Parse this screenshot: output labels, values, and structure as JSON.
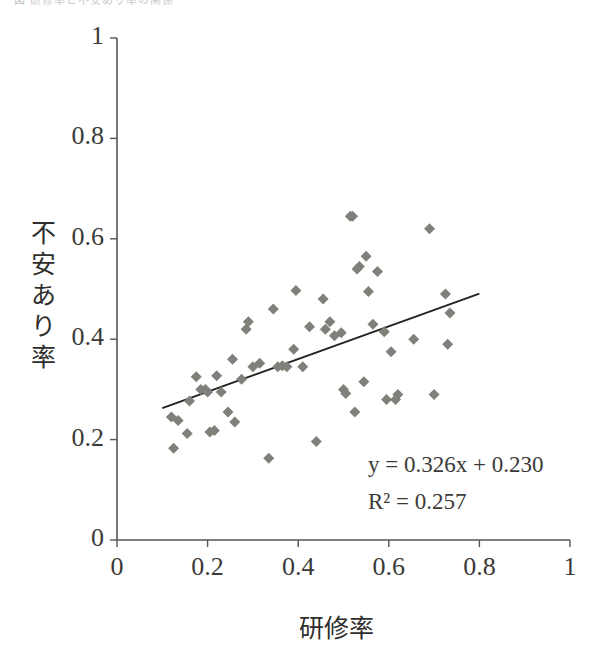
{
  "top_caption": {
    "text": "図  研修率と不安あり率の関係"
  },
  "chart_data": {
    "type": "scatter",
    "title": "",
    "xlabel": "研修率",
    "ylabel": "不安あり率",
    "xlim": [
      0,
      1
    ],
    "ylim": [
      0,
      1
    ],
    "xticks": [
      "0",
      "0.2",
      "0.4",
      "0.6",
      "0.8",
      "1"
    ],
    "yticks": [
      "0",
      "0.2",
      "0.4",
      "0.6",
      "0.8",
      "1"
    ],
    "xtick_values": [
      0,
      0.2,
      0.4,
      0.6,
      0.8,
      1
    ],
    "ytick_values": [
      0,
      0.2,
      0.4,
      0.6,
      0.8,
      1
    ],
    "grid": false,
    "legend": false,
    "marker": "diamond",
    "marker_color": "#80807a",
    "marker_size": 11,
    "axis_color": "#555553",
    "trendline": {
      "color": "#22221f",
      "equation_label": "y = 0.326x + 0.230",
      "r2_label": "R² = 0.257",
      "slope": 0.326,
      "intercept": 0.23,
      "r_squared": 0.257,
      "x_start": 0.1,
      "x_end": 0.8
    },
    "points": [
      [
        0.12,
        0.245
      ],
      [
        0.125,
        0.183
      ],
      [
        0.135,
        0.238
      ],
      [
        0.155,
        0.212
      ],
      [
        0.16,
        0.277
      ],
      [
        0.175,
        0.325
      ],
      [
        0.185,
        0.3
      ],
      [
        0.195,
        0.3
      ],
      [
        0.2,
        0.295
      ],
      [
        0.205,
        0.215
      ],
      [
        0.215,
        0.218
      ],
      [
        0.22,
        0.327
      ],
      [
        0.23,
        0.295
      ],
      [
        0.245,
        0.255
      ],
      [
        0.255,
        0.36
      ],
      [
        0.26,
        0.235
      ],
      [
        0.275,
        0.32
      ],
      [
        0.285,
        0.42
      ],
      [
        0.29,
        0.435
      ],
      [
        0.3,
        0.345
      ],
      [
        0.315,
        0.352
      ],
      [
        0.335,
        0.163
      ],
      [
        0.345,
        0.46
      ],
      [
        0.355,
        0.345
      ],
      [
        0.365,
        0.347
      ],
      [
        0.375,
        0.345
      ],
      [
        0.39,
        0.38
      ],
      [
        0.395,
        0.497
      ],
      [
        0.41,
        0.345
      ],
      [
        0.425,
        0.425
      ],
      [
        0.44,
        0.196
      ],
      [
        0.455,
        0.48
      ],
      [
        0.46,
        0.42
      ],
      [
        0.47,
        0.435
      ],
      [
        0.48,
        0.407
      ],
      [
        0.495,
        0.413
      ],
      [
        0.5,
        0.3
      ],
      [
        0.505,
        0.292
      ],
      [
        0.515,
        0.645
      ],
      [
        0.52,
        0.645
      ],
      [
        0.525,
        0.255
      ],
      [
        0.53,
        0.54
      ],
      [
        0.535,
        0.545
      ],
      [
        0.545,
        0.315
      ],
      [
        0.55,
        0.565
      ],
      [
        0.555,
        0.495
      ],
      [
        0.565,
        0.43
      ],
      [
        0.575,
        0.535
      ],
      [
        0.59,
        0.415
      ],
      [
        0.595,
        0.28
      ],
      [
        0.605,
        0.375
      ],
      [
        0.615,
        0.28
      ],
      [
        0.62,
        0.29
      ],
      [
        0.655,
        0.4
      ],
      [
        0.69,
        0.62
      ],
      [
        0.7,
        0.29
      ],
      [
        0.725,
        0.49
      ],
      [
        0.73,
        0.39
      ],
      [
        0.735,
        0.452
      ]
    ]
  }
}
